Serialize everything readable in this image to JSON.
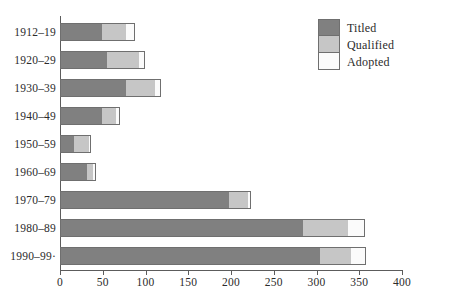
{
  "chart_data": {
    "type": "bar",
    "orientation": "horizontal",
    "stacked": true,
    "title": "",
    "subtitle": "",
    "xlabel": "",
    "ylabel": "",
    "xlim": [
      0,
      400
    ],
    "xticks": [
      0,
      50,
      100,
      150,
      200,
      250,
      300,
      350,
      400
    ],
    "xtick_labels": [
      "0",
      "50",
      "100",
      "150",
      "200",
      "250",
      "300",
      "350",
      "400"
    ],
    "grid": false,
    "legend_position": "top-right",
    "categories": [
      "1912–19",
      "1920–29",
      "1930–39",
      "1940–49",
      "1950–59",
      "1960–69",
      "1970–79",
      "1980–89",
      "1990–99·"
    ],
    "series": [
      {
        "name": "Titled",
        "color": "#808080",
        "values": [
          50,
          56,
          78,
          50,
          18,
          33,
          199,
          285,
          305
        ]
      },
      {
        "name": "Qualified",
        "color": "#c6c6c6",
        "values": [
          30,
          39,
          35,
          18,
          18,
          8,
          23,
          54,
          38
        ]
      },
      {
        "name": "Adopted",
        "color": "#fbfbfb",
        "values": [
          10,
          7,
          8,
          5,
          3,
          4,
          4,
          20,
          17
        ]
      }
    ],
    "totals": [
      90,
      102,
      121,
      73,
      39,
      45,
      226,
      359,
      360
    ]
  },
  "legend": {
    "entries": [
      {
        "label": "Titled"
      },
      {
        "label": "Qualified"
      },
      {
        "label": "Adopted"
      }
    ]
  },
  "colors": {
    "titled": "#808080",
    "qualified": "#c6c6c6",
    "adopted": "#fbfbfb",
    "axis": "#5c5c5c",
    "text": "#2b2b2b",
    "background": "#ffffff"
  }
}
